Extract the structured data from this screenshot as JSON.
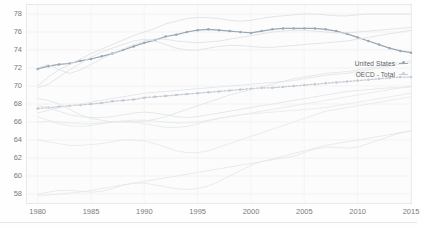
{
  "chart_data": {
    "type": "line",
    "title": "",
    "subtitle": "",
    "xlabel": "",
    "ylabel": "",
    "xlim": [
      1979,
      2015
    ],
    "ylim": [
      57,
      79
    ],
    "ytick_values": [
      78,
      76,
      74,
      72,
      70,
      68,
      66,
      64,
      62,
      60,
      58
    ],
    "xtick_values": [
      1980,
      1985,
      1990,
      1995,
      2000,
      2005,
      2010,
      2015
    ],
    "grid": true,
    "legend_position": "right-inside",
    "highlight_color": "#9aa7b4",
    "background_color": "#fcfcfc",
    "axis_color": "#e9e9e9",
    "faint_series_color": "#d9dde1",
    "x": [
      1980,
      1981,
      1982,
      1983,
      1984,
      1985,
      1986,
      1987,
      1988,
      1989,
      1990,
      1991,
      1992,
      1993,
      1994,
      1995,
      1996,
      1997,
      1998,
      1999,
      2000,
      2001,
      2002,
      2003,
      2004,
      2005,
      2006,
      2007,
      2008,
      2009,
      2010,
      2011,
      2012,
      2013,
      2014,
      2015
    ],
    "series": [
      {
        "name": "United States",
        "highlighted": true,
        "markers": true,
        "color": "#9aa7b4",
        "values": [
          71.9,
          72.2,
          72.4,
          72.5,
          72.8,
          73.0,
          73.3,
          73.6,
          74.0,
          74.4,
          74.8,
          75.1,
          75.5,
          75.7,
          76.0,
          76.2,
          76.3,
          76.2,
          76.1,
          76.0,
          75.9,
          76.1,
          76.3,
          76.4,
          76.4,
          76.4,
          76.4,
          76.3,
          76.1,
          75.8,
          75.4,
          75.0,
          74.6,
          74.2,
          73.9,
          73.7
        ]
      },
      {
        "name": "OECD - Total",
        "highlighted": true,
        "markers": true,
        "dotted": true,
        "color": "#c2cad2",
        "values": [
          67.5,
          67.6,
          67.7,
          67.8,
          67.9,
          68.0,
          68.1,
          68.3,
          68.4,
          68.5,
          68.7,
          68.8,
          68.9,
          69.0,
          69.1,
          69.2,
          69.3,
          69.4,
          69.5,
          69.6,
          69.7,
          69.8,
          69.8,
          69.9,
          70.0,
          70.1,
          70.2,
          70.3,
          70.4,
          70.5,
          70.6,
          70.7,
          70.8,
          70.9,
          71.0,
          71.0
        ]
      },
      {
        "name": "series-a",
        "color": "#dcdfe3",
        "values": [
          70.0,
          71.0,
          71.8,
          72.4,
          73.0,
          73.6,
          74.1,
          74.6,
          75.1,
          75.6,
          76.0,
          76.4,
          76.9,
          77.2,
          77.5,
          77.6,
          77.6,
          77.5,
          77.3,
          77.2,
          77.3,
          77.5,
          77.7,
          77.8,
          77.9,
          78.0,
          78.0,
          77.9,
          77.8,
          77.8,
          77.9,
          78.0,
          78.0,
          78.0,
          78.0,
          78.0
        ]
      },
      {
        "name": "series-b",
        "color": "#dcdfe3",
        "values": [
          72.0,
          72.4,
          71.8,
          71.4,
          71.8,
          72.4,
          73.0,
          73.6,
          74.1,
          74.6,
          75.0,
          75.2,
          75.2,
          75.0,
          74.9,
          74.8,
          74.9,
          75.0,
          75.2,
          75.4,
          75.6,
          75.8,
          76.0,
          76.1,
          76.2,
          76.2,
          76.1,
          76.0,
          75.9,
          75.9,
          76.0,
          76.1,
          76.2,
          76.3,
          76.4,
          76.5
        ]
      },
      {
        "name": "series-c",
        "color": "#dcdfe3",
        "values": [
          69.8,
          70.2,
          71.0,
          71.8,
          72.5,
          73.2,
          73.8,
          74.2,
          74.6,
          75.0,
          75.2,
          75.0,
          74.6,
          74.2,
          74.0,
          74.0,
          74.2,
          74.4,
          74.5,
          74.5,
          74.4,
          74.3,
          74.3,
          74.4,
          74.5,
          74.6,
          74.7,
          74.8,
          74.9,
          75.0,
          75.2,
          75.4,
          75.6,
          75.8,
          76.0,
          76.2
        ]
      },
      {
        "name": "series-d",
        "color": "#e0e3e6",
        "values": [
          67.0,
          67.3,
          67.6,
          67.8,
          68.0,
          68.2,
          68.4,
          68.6,
          68.8,
          69.0,
          69.2,
          69.3,
          69.4,
          69.5,
          69.6,
          69.7,
          69.8,
          69.9,
          70.0,
          70.1,
          70.2,
          70.3,
          70.4,
          70.5,
          70.6,
          70.8,
          71.0,
          71.2,
          71.3,
          71.4,
          71.6,
          71.8,
          72.0,
          72.2,
          72.4,
          72.6
        ]
      },
      {
        "name": "series-e",
        "color": "#e0e3e6",
        "values": [
          67.8,
          67.6,
          67.2,
          66.8,
          66.6,
          66.5,
          66.5,
          66.6,
          66.8,
          67.0,
          67.1,
          67.0,
          66.8,
          66.6,
          66.5,
          66.6,
          66.8,
          67.0,
          67.2,
          67.4,
          67.6,
          67.8,
          68.0,
          68.2,
          68.4,
          68.6,
          68.8,
          69.0,
          69.2,
          69.4,
          69.5,
          69.6,
          69.7,
          69.8,
          69.8,
          69.9
        ]
      },
      {
        "name": "series-f",
        "color": "#e0e3e6",
        "values": [
          68.6,
          68.4,
          68.0,
          67.4,
          66.8,
          66.4,
          66.2,
          66.0,
          66.0,
          66.0,
          66.1,
          66.3,
          66.6,
          67.0,
          67.4,
          67.8,
          68.2,
          68.6,
          69.0,
          69.3,
          69.6,
          69.9,
          70.2,
          70.5,
          70.8,
          71.0,
          71.2,
          71.4,
          71.5,
          71.6,
          71.8,
          72.0,
          72.2,
          72.4,
          72.6,
          72.8
        ]
      },
      {
        "name": "series-g",
        "color": "#e3e6e9",
        "values": [
          58.0,
          58.2,
          58.4,
          58.4,
          58.3,
          58.2,
          58.3,
          58.6,
          59.0,
          59.2,
          59.2,
          59.0,
          58.8,
          58.6,
          58.5,
          58.6,
          58.9,
          59.4,
          60.0,
          60.6,
          61.2,
          61.6,
          61.8,
          62.0,
          62.2,
          62.6,
          63.0,
          63.2,
          63.2,
          63.1,
          63.2,
          63.6,
          64.0,
          64.4,
          64.8,
          65.0
        ]
      },
      {
        "name": "series-h",
        "color": "#e3e6e9",
        "values": [
          57.8,
          57.9,
          58.0,
          58.1,
          58.2,
          58.4,
          58.6,
          58.8,
          59.0,
          59.2,
          59.4,
          59.6,
          59.8,
          60.0,
          60.2,
          60.4,
          60.6,
          60.8,
          61.0,
          61.2,
          61.4,
          61.6,
          61.9,
          62.2,
          62.5,
          62.8,
          63.1,
          63.4,
          63.6,
          63.8,
          64.0,
          64.2,
          64.4,
          64.6,
          64.8,
          65.0
        ]
      },
      {
        "name": "series-i",
        "color": "#e5e8ea",
        "values": [
          66.6,
          66.2,
          65.8,
          65.6,
          65.5,
          65.6,
          65.8,
          66.0,
          66.1,
          66.0,
          65.8,
          65.6,
          65.4,
          65.4,
          65.5,
          65.8,
          66.1,
          66.4,
          66.6,
          66.8,
          66.9,
          67.0,
          67.1,
          67.2,
          67.3,
          67.4,
          67.5,
          67.6,
          67.8,
          68.0,
          68.2,
          68.4,
          68.6,
          68.8,
          69.0,
          69.2
        ]
      },
      {
        "name": "series-j",
        "color": "#e5e8ea",
        "values": [
          66.0,
          66.1,
          66.0,
          65.9,
          65.8,
          65.8,
          65.9,
          66.0,
          66.1,
          66.2,
          66.2,
          66.1,
          66.0,
          65.9,
          65.9,
          66.0,
          66.2,
          66.4,
          66.6,
          66.8,
          67.0,
          67.2,
          67.4,
          67.6,
          67.8,
          68.0,
          68.2,
          68.4,
          68.6,
          68.8,
          69.0,
          69.2,
          69.4,
          69.6,
          69.8,
          70.0
        ]
      },
      {
        "name": "series-k",
        "color": "#e5e8ea",
        "values": [
          64.0,
          63.8,
          63.6,
          63.4,
          63.4,
          63.5,
          63.6,
          63.8,
          64.0,
          64.0,
          63.9,
          63.6,
          63.2,
          62.8,
          62.6,
          62.6,
          62.8,
          63.2,
          63.6,
          64.0,
          64.4,
          64.8,
          65.2,
          65.6,
          66.0,
          66.4,
          66.8,
          67.2,
          67.4,
          67.6,
          67.8,
          68.0,
          68.2,
          68.4,
          68.6,
          68.8
        ]
      }
    ],
    "legend": [
      {
        "label": "United States",
        "color": "#9aa7b4",
        "marker": "circle"
      },
      {
        "label": "OECD - Total",
        "color": "#c2cad2",
        "marker": "dot"
      }
    ]
  }
}
